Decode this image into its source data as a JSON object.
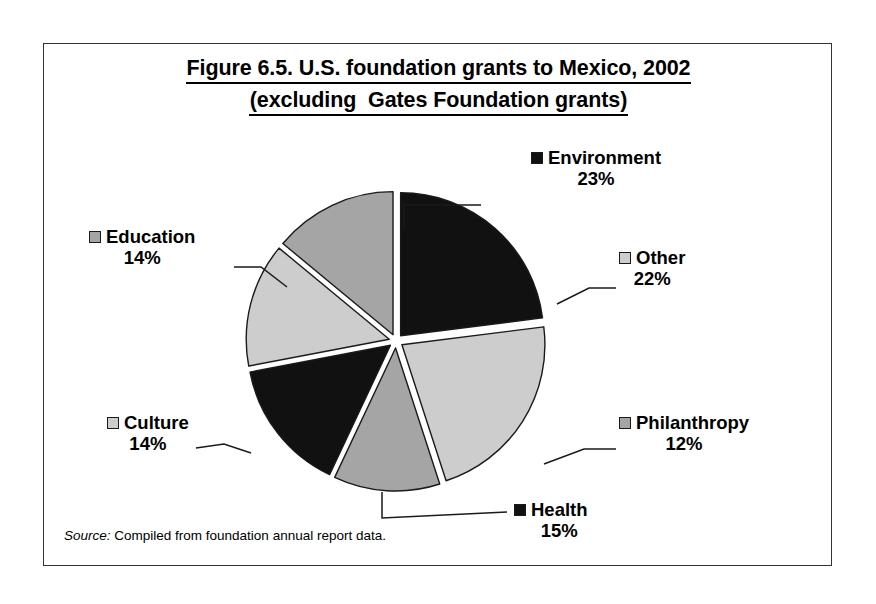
{
  "figure": {
    "title_line_1": "Figure 6.5. U.S. foundation grants to Mexico, 2002",
    "title_line_2": "(excluding  Gates Foundation grants)",
    "source_word": "Source:",
    "source_text": "Compiled from foundation annual report data."
  },
  "labels": {
    "environment": {
      "name": "Environment",
      "pct": "23%",
      "swatch": "black"
    },
    "other": {
      "name": "Other",
      "pct": "22%",
      "swatch": "light"
    },
    "philanthropy": {
      "name": "Philanthropy",
      "pct": "12%",
      "swatch": "mid"
    },
    "health": {
      "name": "Health",
      "pct": "15%",
      "swatch": "black"
    },
    "culture": {
      "name": "Culture",
      "pct": "14%",
      "swatch": "light"
    },
    "education": {
      "name": "Education",
      "pct": "14%",
      "swatch": "mid"
    }
  },
  "colors": {
    "black": "#111111",
    "light_gray": "#cdcdcd",
    "mid_gray": "#a5a5a5",
    "outline": "#1a1a1a",
    "frame": "#333333",
    "background": "#ffffff"
  },
  "chart_data": {
    "type": "pie",
    "title": "Figure 6.5. U.S. foundation grants to Mexico, 2002 (excluding  Gates Foundation grants)",
    "xlabel": "",
    "ylabel": "",
    "exploded": true,
    "start_angle_deg": -90,
    "direction": "clockwise",
    "units": "percent",
    "total": 100,
    "labels": [
      "Environment",
      "Other",
      "Philanthropy",
      "Health",
      "Culture",
      "Education"
    ],
    "values": [
      23,
      22,
      12,
      15,
      14,
      14
    ],
    "value_labels": [
      "23%",
      "22%",
      "12%",
      "15%",
      "14%",
      "14%"
    ],
    "slice_colors": [
      "#111111",
      "#cdcdcd",
      "#a5a5a5",
      "#111111",
      "#cdcdcd",
      "#a5a5a5"
    ],
    "legend": {
      "position": "callout-labels",
      "entries": [
        {
          "label": "Environment",
          "value": 23,
          "color": "#111111"
        },
        {
          "label": "Other",
          "value": 22,
          "color": "#cdcdcd"
        },
        {
          "label": "Philanthropy",
          "value": 12,
          "color": "#a5a5a5"
        },
        {
          "label": "Health",
          "value": 15,
          "color": "#111111"
        },
        {
          "label": "Culture",
          "value": 14,
          "color": "#cdcdcd"
        },
        {
          "label": "Education",
          "value": 14,
          "color": "#a5a5a5"
        }
      ]
    },
    "annotations": [
      "Source: Compiled from foundation annual report data."
    ]
  },
  "geometry": {
    "center_x": 352,
    "center_y": 297,
    "radius": 143,
    "explode_offset": 7
  }
}
